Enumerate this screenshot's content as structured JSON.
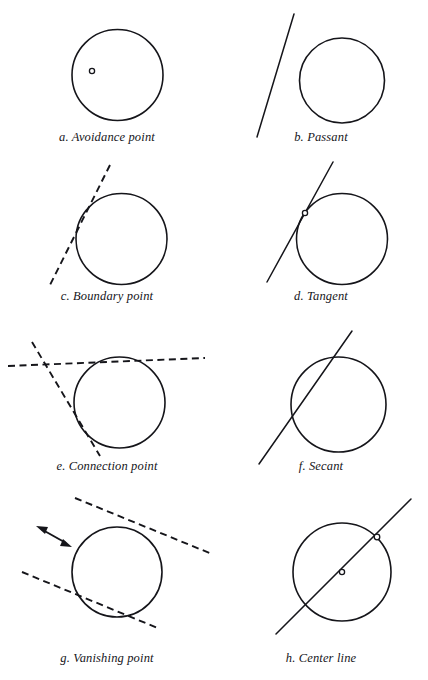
{
  "figure": {
    "background_color": "#ffffff",
    "stroke_color": "#15151a",
    "width": 428,
    "height": 680,
    "columns": 2,
    "rows": 4
  },
  "panels": [
    {
      "id": "a",
      "caption": "a. Avoidance point",
      "caption_x": 0,
      "caption_y": 130,
      "geometry": {
        "circle": {
          "cx": 117.5,
          "cy": 75,
          "r": 45.5
        },
        "line_style": "none",
        "markers": [
          {
            "cx": 92,
            "cy": 71,
            "r": 2.6
          }
        ],
        "lines": []
      }
    },
    {
      "id": "b",
      "caption": "b. Passant",
      "caption_x": 214,
      "caption_y": 130,
      "geometry": {
        "circle": {
          "cx": 128,
          "cy": 80.5,
          "r": 42.5
        },
        "line_style": "solid",
        "markers": [],
        "lines": [
          {
            "x1": 80,
            "y1": 14,
            "x2": 43,
            "y2": 137,
            "style": "solid"
          }
        ]
      }
    },
    {
      "id": "c",
      "caption": "c. Boundary point",
      "caption_x": 0,
      "caption_y": 289,
      "geometry": {
        "circle": {
          "cx": 121.5,
          "cy": 239,
          "r": 45.5
        },
        "line_style": "dashed",
        "markers": [],
        "lines": [
          {
            "x1": 110,
            "y1": 5,
            "x2": 49,
            "y2": 127,
            "style": "dashed"
          }
        ]
      }
    },
    {
      "id": "d",
      "caption": "d. Tangent",
      "caption_x": 214,
      "caption_y": 289,
      "geometry": {
        "circle": {
          "cx": 128,
          "cy": 239,
          "r": 45.5
        },
        "line_style": "solid",
        "markers": [
          {
            "cx": 91,
            "cy": 53,
            "r": 2.6
          }
        ],
        "lines": [
          {
            "x1": 119,
            "y1": 2,
            "x2": 53,
            "y2": 122,
            "style": "solid"
          }
        ]
      }
    },
    {
      "id": "e",
      "caption": "e. Connection point",
      "caption_x": 0,
      "caption_y": 459,
      "geometry": {
        "circle": {
          "cx": 119.5,
          "cy": 402.5,
          "r": 45.5
        },
        "line_style": "dashed",
        "markers": [],
        "lines": [
          {
            "x1": 8,
            "y1": 41,
            "x2": 205,
            "y2": 33,
            "style": "dashed"
          },
          {
            "x1": 32,
            "y1": 17,
            "x2": 100,
            "y2": 131,
            "style": "dashed"
          }
        ]
      }
    },
    {
      "id": "f",
      "caption": "f. Secant",
      "caption_x": 214,
      "caption_y": 459,
      "geometry": {
        "circle": {
          "cx": 124.5,
          "cy": 404.5,
          "r": 47.5
        },
        "line_style": "solid",
        "markers": [],
        "lines": [
          {
            "x1": 138,
            "y1": 6,
            "x2": 45,
            "y2": 139,
            "style": "solid"
          }
        ]
      }
    },
    {
      "id": "g",
      "caption": "g. Vanishing point",
      "caption_x": 0,
      "caption_y": 651,
      "geometry": {
        "circle": {
          "cx": 117,
          "cy": 572,
          "r": 45
        },
        "line_style": "dashed",
        "markers": [],
        "lines": [
          {
            "x1": 75,
            "y1": 14,
            "x2": 212,
            "y2": 70,
            "style": "dashed"
          },
          {
            "x1": 22,
            "y1": 88,
            "x2": 160,
            "y2": 145,
            "style": "dashed"
          }
        ],
        "arrow": {
          "x1": 36,
          "y1": 43,
          "x2": 71,
          "y2": 62,
          "double_headed": true
        }
      }
    },
    {
      "id": "h",
      "caption": "h. Center line",
      "caption_x": 214,
      "caption_y": 651,
      "geometry": {
        "circle": {
          "cx": 128,
          "cy": 572,
          "r": 49
        },
        "line_style": "solid",
        "markers": [
          {
            "cx": 128,
            "cy": 82,
            "r": 2.6
          },
          {
            "cx": 163,
            "cy": 57,
            "r": 2.8
          }
        ],
        "lines": [
          {
            "x1": 197,
            "y1": 15,
            "x2": 62,
            "y2": 150,
            "style": "solid"
          }
        ]
      }
    }
  ]
}
